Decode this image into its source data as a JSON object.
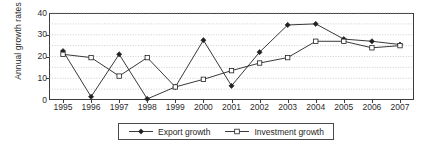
{
  "chart_data": {
    "type": "line",
    "title": "",
    "xlabel": "",
    "ylabel": "Annual growth rates",
    "categories": [
      "1995",
      "1996",
      "1997",
      "1998",
      "1999",
      "2000",
      "2001",
      "2002",
      "2003",
      "2004",
      "2005",
      "2006",
      "2007"
    ],
    "x": [
      1995,
      1996,
      1997,
      1998,
      1999,
      2000,
      2001,
      2002,
      2003,
      2004,
      2005,
      2006,
      2007
    ],
    "ylim": [
      0,
      40
    ],
    "yticks": [
      0,
      10,
      20,
      30,
      40
    ],
    "grid": "horizontal-dotted",
    "legend_position": "bottom-center",
    "series": [
      {
        "name": "Export growth",
        "marker": "filled-diamond",
        "color": "#222222",
        "values": [
          22.5,
          1.5,
          21.0,
          0.5,
          6.0,
          27.5,
          6.5,
          22.0,
          34.5,
          35.0,
          28.0,
          27.0,
          25.5
        ]
      },
      {
        "name": "Investment growth",
        "marker": "open-square",
        "color": "#222222",
        "values": [
          21.0,
          19.5,
          11.0,
          19.5,
          6.0,
          9.5,
          13.5,
          17.0,
          19.5,
          27.0,
          27.0,
          24.0,
          25.0
        ]
      }
    ]
  },
  "axis": {
    "y_title": "Annual growth rates",
    "y_tick_labels": [
      "0",
      "10",
      "20",
      "30",
      "40"
    ],
    "x_tick_labels": [
      "1995",
      "1996",
      "1997",
      "1998",
      "1999",
      "2000",
      "2001",
      "2002",
      "2003",
      "2004",
      "2005",
      "2006",
      "2007"
    ]
  },
  "legend": {
    "items": [
      {
        "label": "Export growth",
        "marker": "filled-diamond"
      },
      {
        "label": "Investment growth",
        "marker": "open-square"
      }
    ]
  },
  "colors": {
    "axis": "#3c3c3c",
    "grid": "#b8b8b8",
    "series_export": "#222222",
    "series_investment": "#222222",
    "text": "#2b2b2b",
    "background": "#ffffff"
  }
}
